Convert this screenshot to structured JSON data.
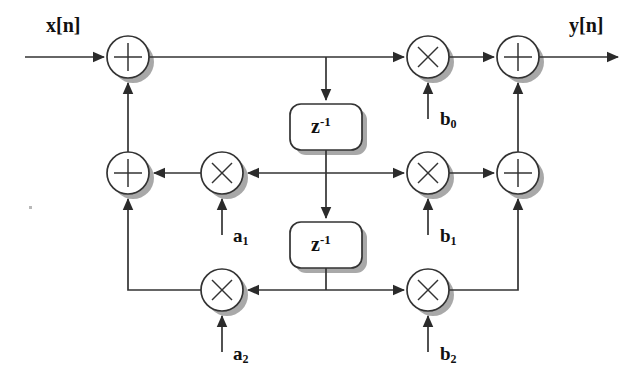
{
  "diagram": {
    "type": "signal-flow-graph",
    "colors": {
      "line": "#333333",
      "shadow": "#9a9a9a",
      "node_fill": "#ffffff",
      "node_stroke": "#333333",
      "text": "#111111",
      "background": "#ffffff"
    },
    "labels": {
      "input": "x[n]",
      "output": "y[n]",
      "delay_1": "z",
      "delay_1_exp": "-1",
      "delay_2": "z",
      "delay_2_exp": "-1",
      "a1": "a",
      "a1_sub": "1",
      "a2": "a",
      "a2_sub": "2",
      "b0": "b",
      "b0_sub": "0",
      "b1": "b",
      "b1_sub": "1",
      "b2": "b",
      "b2_sub": "2"
    },
    "nodes": [
      {
        "id": "adder-top-left",
        "kind": "adder",
        "glyph": "+",
        "cx": 128,
        "cy": 57,
        "r": 21
      },
      {
        "id": "adder-mid-left",
        "kind": "adder",
        "glyph": "+",
        "cx": 128,
        "cy": 173,
        "r": 21
      },
      {
        "id": "mult-a1",
        "kind": "multiplier",
        "glyph": "x",
        "cx": 222,
        "cy": 173,
        "r": 21
      },
      {
        "id": "mult-a2",
        "kind": "multiplier",
        "glyph": "x",
        "cx": 222,
        "cy": 290,
        "r": 21
      },
      {
        "id": "mult-b0",
        "kind": "multiplier",
        "glyph": "x",
        "cx": 428,
        "cy": 57,
        "r": 21
      },
      {
        "id": "mult-b1",
        "kind": "multiplier",
        "glyph": "x",
        "cx": 428,
        "cy": 173,
        "r": 21
      },
      {
        "id": "mult-b2",
        "kind": "multiplier",
        "glyph": "x",
        "cx": 428,
        "cy": 290,
        "r": 21
      },
      {
        "id": "adder-top-right",
        "kind": "adder",
        "glyph": "+",
        "cx": 518,
        "cy": 57,
        "r": 21
      },
      {
        "id": "adder-mid-right",
        "kind": "adder",
        "glyph": "+",
        "cx": 518,
        "cy": 173,
        "r": 21
      }
    ],
    "delay_blocks": [
      {
        "id": "delay-1",
        "x": 290,
        "y": 104,
        "w": 72,
        "h": 46
      },
      {
        "id": "delay-2",
        "x": 290,
        "y": 222,
        "w": 72,
        "h": 46
      }
    ],
    "equation": {
      "description": "y[n] = b0*w[n] + b1*w[n-1] + b2*w[n-2], w[n] = x[n] + a1*w[n-1] + a2*w[n-2]",
      "feedforward_coefficients": [
        "b0",
        "b1",
        "b2"
      ],
      "feedback_coefficients": [
        "a1",
        "a2"
      ]
    }
  }
}
